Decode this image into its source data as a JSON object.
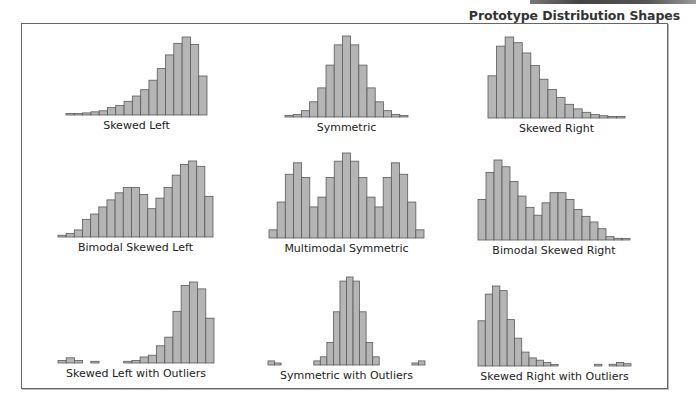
{
  "header": {
    "title": "Prototype Distribution Shapes"
  },
  "colors": {
    "bar_fill": "#b5b5b5",
    "bar_stroke": "#5a5a5a",
    "frame": "#666666"
  },
  "chart_data": [
    {
      "type": "bar",
      "title": "Skewed Left",
      "panel": [
        66,
        115,
        141,
        78
      ],
      "values": [
        1,
        1.5,
        2,
        3,
        4,
        7,
        9,
        13,
        18,
        24,
        33,
        44,
        57,
        68,
        74,
        67,
        37
      ]
    },
    {
      "type": "bar",
      "title": "Symmetric",
      "panel": [
        285,
        117,
        123,
        81
      ],
      "values": [
        1,
        2,
        5,
        12,
        23,
        41,
        57,
        64,
        57,
        41,
        23,
        12,
        5,
        2,
        1
      ]
    },
    {
      "type": "bar",
      "title": "Skewed Right",
      "panel": [
        488,
        118,
        137,
        81
      ],
      "values": [
        37,
        63,
        71,
        66,
        57,
        46,
        34,
        25,
        18,
        12,
        8,
        5,
        3,
        2,
        1,
        0.5
      ]
    },
    {
      "type": "bar",
      "title": "Bimodal Skewed Left",
      "panel": [
        58,
        237,
        155,
        76
      ],
      "values": [
        1,
        2,
        4,
        10,
        13,
        17,
        21,
        25,
        28,
        28,
        24,
        16,
        22,
        28,
        35,
        41,
        43,
        40,
        23
      ]
    },
    {
      "type": "bar",
      "title": "Multimodal Symmetric",
      "panel": [
        269,
        238,
        155,
        85
      ],
      "values": [
        5,
        22,
        39,
        46,
        37,
        19,
        25,
        37,
        47,
        52,
        47,
        37,
        25,
        19,
        37,
        46,
        39,
        22,
        5
      ]
    },
    {
      "type": "bar",
      "title": "Bimodal Skewed Right",
      "panel": [
        478,
        240,
        152,
        80
      ],
      "values": [
        36,
        60,
        71,
        65,
        52,
        39,
        29,
        22,
        33,
        42,
        42,
        36,
        27,
        21,
        16,
        10,
        3,
        1.5,
        1
      ]
    },
    {
      "type": "bar",
      "title": "Skewed Left with Outliers",
      "panel": [
        58,
        363,
        156,
        81
      ],
      "values": [
        1.5,
        3,
        1.5,
        0,
        1,
        0,
        0,
        0,
        1,
        1.5,
        3.5,
        4.5,
        10,
        15,
        30,
        45,
        47,
        43,
        26
      ]
    },
    {
      "type": "bar",
      "title": "Symmetric with Outliers",
      "panel": [
        268,
        365,
        157,
        88
      ],
      "values": [
        2,
        1,
        0,
        0,
        0,
        0,
        0,
        2,
        4,
        11,
        26,
        41,
        43,
        41,
        26,
        11,
        4,
        0,
        0,
        0,
        0,
        0,
        1,
        2
      ]
    },
    {
      "type": "bar",
      "title": "Skewed Right with Outliers",
      "panel": [
        478,
        366,
        153,
        80
      ],
      "values": [
        39,
        62,
        69,
        65,
        40,
        24,
        12,
        7,
        5,
        3,
        1,
        0,
        0,
        0,
        0,
        0,
        1.5,
        0,
        1.5,
        3,
        2
      ]
    }
  ]
}
